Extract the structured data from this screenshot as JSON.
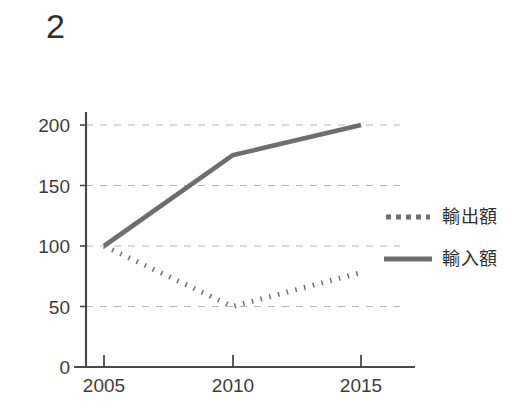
{
  "figure": {
    "number_label": "2",
    "background_color": "#ffffff",
    "ink_color": "#6e6e6e",
    "text_color": "#2f2f2f",
    "gridline_color": "#b5b5b5",
    "axis_color": "#4a4a4a"
  },
  "legend": {
    "position": "right-middle",
    "entries": [
      {
        "label": "輸出額",
        "style": "dotted",
        "sample_name": "dotted-line-sample"
      },
      {
        "label": "輸入額",
        "style": "solid",
        "sample_name": "solid-line-sample"
      }
    ]
  },
  "axes": {
    "y_ticks": [
      "200",
      "150",
      "100",
      "50",
      "0"
    ],
    "x_ticks": [
      "2005",
      "2010",
      "2015"
    ]
  },
  "chart_data": {
    "type": "line",
    "title": "2",
    "xlabel": "",
    "ylabel": "",
    "x": [
      2005,
      2010,
      2015
    ],
    "categories": [
      "2005",
      "2010",
      "2015"
    ],
    "series": [
      {
        "name": "輸出額",
        "style": "dotted",
        "color": "#6e6e6e",
        "values": [
          100,
          50,
          78
        ]
      },
      {
        "name": "輸入額",
        "style": "solid",
        "color": "#6e6e6e",
        "values": [
          100,
          175,
          200
        ]
      }
    ],
    "xlim": [
      2004,
      2016.2
    ],
    "ylim": [
      0,
      212
    ],
    "yticks": [
      0,
      50,
      100,
      150,
      200
    ],
    "xticks": [
      2005,
      2010,
      2015
    ],
    "grid": "horizontal-dashed",
    "legend_position": "right",
    "annotations": []
  }
}
